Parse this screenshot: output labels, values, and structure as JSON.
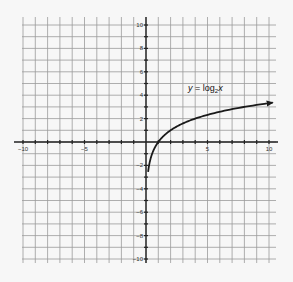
{
  "chart_data": {
    "type": "line",
    "title": "",
    "equation_label": {
      "prefix": "y = log",
      "base": "2",
      "suffix": "x"
    },
    "function": "log2(x)",
    "xlabel": "",
    "ylabel": "",
    "xlim": [
      -10,
      10
    ],
    "ylim": [
      -10,
      10
    ],
    "grid": true,
    "grid_step": 1,
    "x_tick_labels": [
      -10,
      -5,
      5,
      10
    ],
    "y_tick_labels": [
      10,
      8,
      6,
      4,
      2,
      -2,
      -4,
      -6,
      -8,
      -10
    ],
    "series": [
      {
        "name": "y = log2 x",
        "x": [
          0.17,
          0.25,
          0.5,
          1,
          2,
          4,
          8,
          10.3
        ],
        "y": [
          -2.56,
          -2,
          -1,
          0,
          1,
          2,
          3,
          3.36
        ],
        "arrow_end": true
      }
    ],
    "legend": {
      "position": "inline-near-curve"
    }
  },
  "colors": {
    "background": "#f7f7f7",
    "grid": "#9a9a9a",
    "axis": "#222222",
    "curve": "#1a1a1a"
  }
}
